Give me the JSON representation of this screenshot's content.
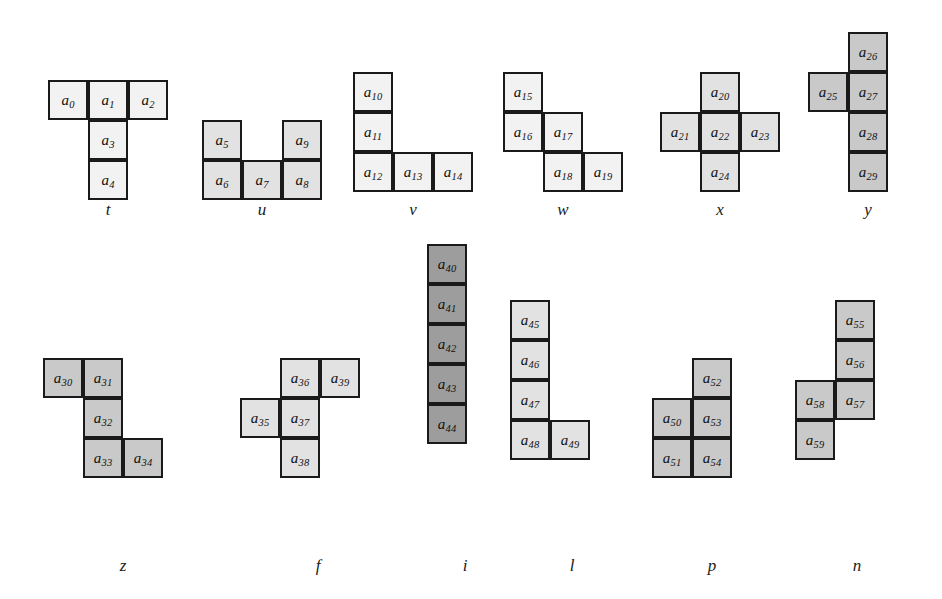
{
  "figure": {
    "cell_size": 40,
    "colors": {
      "background": "#ffffff",
      "border": "#1a1a1a",
      "shade_very_light": "#f2f2f2",
      "shade_light": "#e2e2e2",
      "shade_mid": "#c9c9c9",
      "shade_dark": "#9d9d9d"
    },
    "pieces": [
      {
        "name": "t",
        "label": "t",
        "shade": "shade-vlight",
        "origin": {
          "x": 48,
          "y": 80
        },
        "label_pos": {
          "x": 108,
          "y": 200
        },
        "cells": [
          {
            "id": "a0",
            "base": "a",
            "sub": "0",
            "col": 0,
            "row": 0
          },
          {
            "id": "a1",
            "base": "a",
            "sub": "1",
            "col": 1,
            "row": 0
          },
          {
            "id": "a2",
            "base": "a",
            "sub": "2",
            "col": 2,
            "row": 0
          },
          {
            "id": "a3",
            "base": "a",
            "sub": "3",
            "col": 1,
            "row": 1
          },
          {
            "id": "a4",
            "base": "a",
            "sub": "4",
            "col": 1,
            "row": 2
          }
        ]
      },
      {
        "name": "u",
        "label": "u",
        "shade": "shade-light",
        "origin": {
          "x": 202,
          "y": 120
        },
        "label_pos": {
          "x": 262,
          "y": 200
        },
        "cells": [
          {
            "id": "a5",
            "base": "a",
            "sub": "5",
            "col": 0,
            "row": 0
          },
          {
            "id": "a9",
            "base": "a",
            "sub": "9",
            "col": 2,
            "row": 0
          },
          {
            "id": "a6",
            "base": "a",
            "sub": "6",
            "col": 0,
            "row": 1
          },
          {
            "id": "a7",
            "base": "a",
            "sub": "7",
            "col": 1,
            "row": 1
          },
          {
            "id": "a8",
            "base": "a",
            "sub": "8",
            "col": 2,
            "row": 1
          }
        ]
      },
      {
        "name": "v",
        "label": "v",
        "shade": "shade-vlight",
        "origin": {
          "x": 353,
          "y": 72
        },
        "label_pos": {
          "x": 413,
          "y": 200
        },
        "cells": [
          {
            "id": "a10",
            "base": "a",
            "sub": "10",
            "col": 0,
            "row": 0
          },
          {
            "id": "a11",
            "base": "a",
            "sub": "11",
            "col": 0,
            "row": 1
          },
          {
            "id": "a12",
            "base": "a",
            "sub": "12",
            "col": 0,
            "row": 2
          },
          {
            "id": "a13",
            "base": "a",
            "sub": "13",
            "col": 1,
            "row": 2
          },
          {
            "id": "a14",
            "base": "a",
            "sub": "14",
            "col": 2,
            "row": 2
          }
        ]
      },
      {
        "name": "w",
        "label": "w",
        "shade": "shade-vlight",
        "origin": {
          "x": 503,
          "y": 72
        },
        "label_pos": {
          "x": 563,
          "y": 200
        },
        "cells": [
          {
            "id": "a15",
            "base": "a",
            "sub": "15",
            "col": 0,
            "row": 0
          },
          {
            "id": "a16",
            "base": "a",
            "sub": "16",
            "col": 0,
            "row": 1
          },
          {
            "id": "a17",
            "base": "a",
            "sub": "17",
            "col": 1,
            "row": 1
          },
          {
            "id": "a18",
            "base": "a",
            "sub": "18",
            "col": 1,
            "row": 2
          },
          {
            "id": "a19",
            "base": "a",
            "sub": "19",
            "col": 2,
            "row": 2
          }
        ]
      },
      {
        "name": "x",
        "label": "x",
        "shade": "shade-light",
        "origin": {
          "x": 660,
          "y": 72
        },
        "label_pos": {
          "x": 720,
          "y": 200
        },
        "cells": [
          {
            "id": "a20",
            "base": "a",
            "sub": "20",
            "col": 1,
            "row": 0
          },
          {
            "id": "a21",
            "base": "a",
            "sub": "21",
            "col": 0,
            "row": 1
          },
          {
            "id": "a22",
            "base": "a",
            "sub": "22",
            "col": 1,
            "row": 1
          },
          {
            "id": "a23",
            "base": "a",
            "sub": "23",
            "col": 2,
            "row": 1
          },
          {
            "id": "a24",
            "base": "a",
            "sub": "24",
            "col": 1,
            "row": 2
          }
        ]
      },
      {
        "name": "y",
        "label": "y",
        "shade": "shade-mid",
        "origin": {
          "x": 808,
          "y": 32
        },
        "label_pos": {
          "x": 868,
          "y": 200
        },
        "cells": [
          {
            "id": "a26",
            "base": "a",
            "sub": "26",
            "col": 1,
            "row": 0
          },
          {
            "id": "a25",
            "base": "a",
            "sub": "25",
            "col": 0,
            "row": 1
          },
          {
            "id": "a27",
            "base": "a",
            "sub": "27",
            "col": 1,
            "row": 1
          },
          {
            "id": "a28",
            "base": "a",
            "sub": "28",
            "col": 1,
            "row": 2
          },
          {
            "id": "a29",
            "base": "a",
            "sub": "29",
            "col": 1,
            "row": 3
          }
        ]
      },
      {
        "name": "z",
        "label": "z",
        "shade": "shade-mid",
        "origin": {
          "x": 43,
          "y": 358
        },
        "label_pos": {
          "x": 123,
          "y": 556
        },
        "cells": [
          {
            "id": "a30",
            "base": "a",
            "sub": "30",
            "col": 0,
            "row": 0
          },
          {
            "id": "a31",
            "base": "a",
            "sub": "31",
            "col": 1,
            "row": 0
          },
          {
            "id": "a32",
            "base": "a",
            "sub": "32",
            "col": 1,
            "row": 1
          },
          {
            "id": "a33",
            "base": "a",
            "sub": "33",
            "col": 1,
            "row": 2
          },
          {
            "id": "a34",
            "base": "a",
            "sub": "34",
            "col": 2,
            "row": 2
          }
        ]
      },
      {
        "name": "f",
        "label": "f",
        "shade": "shade-light",
        "origin": {
          "x": 240,
          "y": 358
        },
        "label_pos": {
          "x": 318,
          "y": 556
        },
        "cells": [
          {
            "id": "a36",
            "base": "a",
            "sub": "36",
            "col": 1,
            "row": 0
          },
          {
            "id": "a39",
            "base": "a",
            "sub": "39",
            "col": 2,
            "row": 0
          },
          {
            "id": "a35",
            "base": "a",
            "sub": "35",
            "col": 0,
            "row": 1
          },
          {
            "id": "a37",
            "base": "a",
            "sub": "37",
            "col": 1,
            "row": 1
          },
          {
            "id": "a38",
            "base": "a",
            "sub": "38",
            "col": 1,
            "row": 2
          }
        ]
      },
      {
        "name": "i",
        "label": "i",
        "shade": "shade-dark",
        "origin": {
          "x": 427,
          "y": 244
        },
        "label_pos": {
          "x": 465,
          "y": 556
        },
        "cells": [
          {
            "id": "a40",
            "base": "a",
            "sub": "40",
            "col": 0,
            "row": 0
          },
          {
            "id": "a41",
            "base": "a",
            "sub": "41",
            "col": 0,
            "row": 1
          },
          {
            "id": "a42",
            "base": "a",
            "sub": "42",
            "col": 0,
            "row": 2
          },
          {
            "id": "a43",
            "base": "a",
            "sub": "43",
            "col": 0,
            "row": 3
          },
          {
            "id": "a44",
            "base": "a",
            "sub": "44",
            "col": 0,
            "row": 4
          }
        ]
      },
      {
        "name": "l",
        "label": "l",
        "shade": "shade-light",
        "origin": {
          "x": 510,
          "y": 300
        },
        "label_pos": {
          "x": 572,
          "y": 556
        },
        "cells": [
          {
            "id": "a45",
            "base": "a",
            "sub": "45",
            "col": 0,
            "row": 0
          },
          {
            "id": "a46",
            "base": "a",
            "sub": "46",
            "col": 0,
            "row": 1
          },
          {
            "id": "a47",
            "base": "a",
            "sub": "47",
            "col": 0,
            "row": 2
          },
          {
            "id": "a48",
            "base": "a",
            "sub": "48",
            "col": 0,
            "row": 3
          },
          {
            "id": "a49",
            "base": "a",
            "sub": "49",
            "col": 1,
            "row": 3
          }
        ]
      },
      {
        "name": "p",
        "label": "p",
        "shade": "shade-mid",
        "origin": {
          "x": 652,
          "y": 358
        },
        "label_pos": {
          "x": 712,
          "y": 556
        },
        "cells": [
          {
            "id": "a52",
            "base": "a",
            "sub": "52",
            "col": 1,
            "row": 0
          },
          {
            "id": "a50",
            "base": "a",
            "sub": "50",
            "col": 0,
            "row": 1
          },
          {
            "id": "a53",
            "base": "a",
            "sub": "53",
            "col": 1,
            "row": 1
          },
          {
            "id": "a51",
            "base": "a",
            "sub": "51",
            "col": 0,
            "row": 2
          },
          {
            "id": "a54",
            "base": "a",
            "sub": "54",
            "col": 1,
            "row": 2
          }
        ]
      },
      {
        "name": "n",
        "label": "n",
        "shade": "shade-mid",
        "origin": {
          "x": 795,
          "y": 300
        },
        "label_pos": {
          "x": 857,
          "y": 556
        },
        "cells": [
          {
            "id": "a55",
            "base": "a",
            "sub": "55",
            "col": 1,
            "row": 0
          },
          {
            "id": "a56",
            "base": "a",
            "sub": "56",
            "col": 1,
            "row": 1
          },
          {
            "id": "a58",
            "base": "a",
            "sub": "58",
            "col": 0,
            "row": 2
          },
          {
            "id": "a57",
            "base": "a",
            "sub": "57",
            "col": 1,
            "row": 2
          },
          {
            "id": "a59",
            "base": "a",
            "sub": "59",
            "col": 0,
            "row": 3
          }
        ]
      }
    ]
  }
}
